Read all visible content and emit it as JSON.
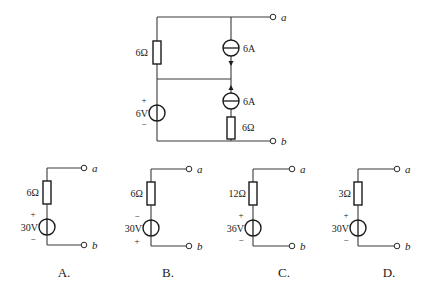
{
  "main_circuit": {
    "resistor_top": "6Ω",
    "current_source_top": "6A",
    "current_source_bottom": "6A",
    "resistor_bottom": "6Ω",
    "voltage_source": "6V",
    "voltage_plus": "+",
    "voltage_minus": "−",
    "terminal_a": "a",
    "terminal_b": "b"
  },
  "options": [
    {
      "label": "A.",
      "resistor": "6Ω",
      "voltage": "30V",
      "top_sign": "+",
      "bottom_sign": "−",
      "terminal_a": "a",
      "terminal_b": "b"
    },
    {
      "label": "B.",
      "resistor": "6Ω",
      "voltage": "30V",
      "top_sign": "−",
      "bottom_sign": "+",
      "terminal_a": "a",
      "terminal_b": "b"
    },
    {
      "label": "C.",
      "resistor": "12Ω",
      "voltage": "36V",
      "top_sign": "+",
      "bottom_sign": "−",
      "terminal_a": "a",
      "terminal_b": "b"
    },
    {
      "label": "D.",
      "resistor": "3Ω",
      "voltage": "30V",
      "top_sign": "+",
      "bottom_sign": "−",
      "terminal_a": "a",
      "terminal_b": "b"
    }
  ]
}
